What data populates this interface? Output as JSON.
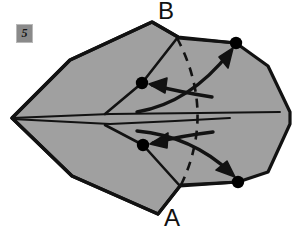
{
  "figure": {
    "step_badge": "5",
    "colors": {
      "paper_fill": "#a0a0a0",
      "outline": "#121212",
      "background": "#ffffff",
      "badge_fill": "#8a8a8a",
      "dot_fill": "#000000"
    }
  },
  "labels": {
    "vertex_top": "B",
    "vertex_bottom": "A"
  },
  "points": [
    {
      "name": "left-tip",
      "x": 12,
      "y": 118
    },
    {
      "name": "upper-inner-dot",
      "x": 142,
      "y": 83
    },
    {
      "name": "lower-inner-dot",
      "x": 143,
      "y": 145
    },
    {
      "name": "upper-outer-dot",
      "x": 236,
      "y": 43
    },
    {
      "name": "lower-outer-dot",
      "x": 238,
      "y": 182
    }
  ],
  "arrows": [
    {
      "name": "arrow-upper-inward",
      "from": "upper-outer-dot",
      "to": "upper-inner-dot",
      "style": "solid-curved"
    },
    {
      "name": "arrow-upper-outward",
      "from": "lower-inner-area",
      "to": "upper-outer-dot",
      "style": "solid-curved"
    },
    {
      "name": "arrow-lower-inward",
      "from": "lower-outer-dot",
      "to": "lower-inner-dot",
      "style": "solid-curved"
    },
    {
      "name": "arrow-lower-outward",
      "from": "upper-inner-area",
      "to": "lower-outer-dot",
      "style": "solid-curved"
    }
  ],
  "fold_lines": [
    {
      "name": "dashed-fold-line",
      "style": "dashed",
      "from_y": 37,
      "to_y": 186
    },
    {
      "name": "center-horizontal-crease",
      "style": "solid"
    }
  ]
}
